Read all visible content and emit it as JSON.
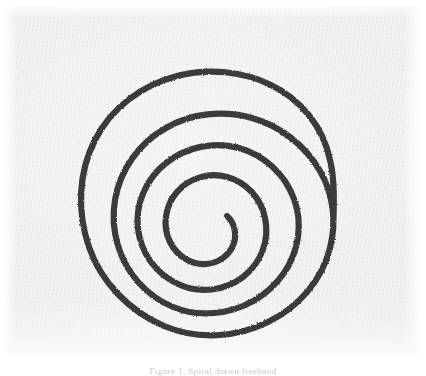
{
  "image": {
    "title": "Hand-drawn spiral",
    "medium": "scanned ink drawing on paper",
    "width": 426,
    "height": 376,
    "paper_color": "#f2f2f2",
    "page_color": "#ffffff",
    "ink_color": "#3a3a3a"
  },
  "drawing": {
    "subject_name": "spiral",
    "description": "single continuous hand-drawn spiral line winding inward",
    "turns": "3.5",
    "winding_direction": "clockwise-inward",
    "stroke_width_px": 6,
    "center_x": 207,
    "center_y": 212,
    "outer_end_x": 333,
    "outer_end_y": 230,
    "inner_end_x": 213,
    "inner_end_y": 236,
    "bounds": {
      "left": 78,
      "top": 72,
      "right": 336,
      "bottom": 338
    }
  },
  "caption": {
    "text": "Figure 1. Spiral drawn freehand",
    "visibility": "clipped at bottom edge"
  }
}
